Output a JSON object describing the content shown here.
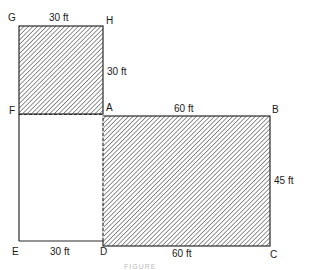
{
  "diagram": {
    "vertices": {
      "G": "G",
      "H": "H",
      "F": "F",
      "A": "A",
      "B": "B",
      "C": "C",
      "D": "D",
      "E": "E"
    },
    "dimensions": {
      "GH": "30 ft",
      "HA": "30 ft",
      "AB": "60 ft",
      "BC": "45 ft",
      "ED": "30 ft",
      "DC": "60 ft"
    },
    "regions": [
      {
        "name": "square-GHAF",
        "shaded": true,
        "width": "30 ft",
        "height": "30 ft"
      },
      {
        "name": "rectangle-ABCD",
        "shaded": true,
        "width": "60 ft",
        "height": "45 ft"
      },
      {
        "name": "rectangle-FADE",
        "shaded": false
      }
    ],
    "caption": "FIGURE"
  },
  "colors": {
    "line": "#2a2a2a",
    "hatch": "#3a3a3a",
    "background": "#ffffff"
  }
}
